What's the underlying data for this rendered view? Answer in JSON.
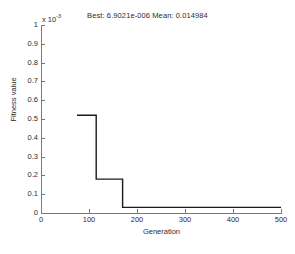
{
  "chart_data": {
    "type": "line",
    "title": "Best: 6.9021e-006 Mean: 0.014984",
    "xlabel": "Generation",
    "ylabel": "Fitness value",
    "y_exponent_prefix": "x 10",
    "y_exponent_power": "-3",
    "y_multiplier": 0.001,
    "xlim": [
      0,
      500
    ],
    "ylim": [
      0,
      1
    ],
    "grid": false,
    "legend": null,
    "xticks": [
      0,
      100,
      200,
      300,
      400,
      500
    ],
    "xtick_labels": [
      "0",
      "100",
      "200",
      "300",
      "400",
      "500"
    ],
    "yticks": [
      0,
      0.1,
      0.2,
      0.3,
      0.4,
      0.5,
      0.6,
      0.7,
      0.8,
      0.9,
      1
    ],
    "ytick_labels": [
      "0",
      "0.1",
      "0.2",
      "0.3",
      "0.4",
      "0.5",
      "0.6",
      "0.7",
      "0.8",
      "0.9",
      "1"
    ],
    "series": [
      {
        "name": "Best fitness",
        "color": "#1a1a1a",
        "points": [
          {
            "x": 75,
            "y": 0.52
          },
          {
            "x": 115,
            "y": 0.52
          },
          {
            "x": 115,
            "y": 0.18
          },
          {
            "x": 170,
            "y": 0.18
          },
          {
            "x": 170,
            "y": 0.03
          },
          {
            "x": 500,
            "y": 0.03
          }
        ]
      }
    ],
    "annotations": {
      "best_value": "6.9021e-006",
      "mean_value": "0.014984"
    }
  }
}
